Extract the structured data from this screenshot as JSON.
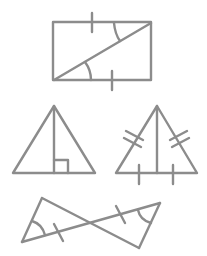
{
  "diagram": {
    "stroke_color": "#8c8c8c",
    "background": "#ffffff",
    "figures": [
      {
        "name": "rectangle-with-diagonal",
        "description": "Rectangle split by a diagonal into two triangles; opposite sides marked equal with single ticks; alternate interior angles marked with arcs",
        "vertices": [
          [
            53,
            22
          ],
          [
            151,
            22
          ],
          [
            151,
            80
          ],
          [
            53,
            80
          ]
        ],
        "diagonal": [
          [
            53,
            80
          ],
          [
            151,
            22
          ]
        ]
      },
      {
        "name": "isosceles-triangle-altitude",
        "description": "Triangle with altitude from apex and right-angle marker at base",
        "vertices": [
          [
            54,
            106
          ],
          [
            13,
            173
          ],
          [
            95,
            173
          ]
        ],
        "altitude": [
          [
            54,
            106
          ],
          [
            54,
            173
          ]
        ]
      },
      {
        "name": "triangle-median-marked",
        "description": "Triangle with segment from apex to base midpoint; sides marked with double ticks, base halves with single ticks",
        "vertices": [
          [
            157,
            106
          ],
          [
            116,
            173
          ],
          [
            197,
            173
          ]
        ],
        "median": [
          [
            157,
            106
          ],
          [
            157,
            173
          ]
        ]
      },
      {
        "name": "bowtie-triangles",
        "description": "Two triangles meeting at a vertical-angle intersection; matching single ticks and angle arcs",
        "vertices": [
          [
            42,
            198
          ],
          [
            22,
            242
          ],
          [
            160,
            203
          ],
          [
            139,
            248
          ]
        ]
      }
    ]
  }
}
